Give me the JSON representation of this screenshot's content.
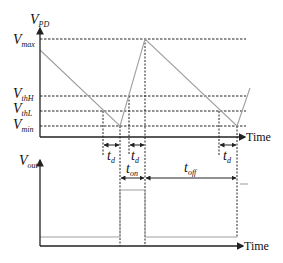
{
  "top_plot": {
    "y_axis_label": "V",
    "y_axis_label_sub": "PD",
    "x_axis_label": "Time",
    "levels": [
      {
        "key": "max",
        "label": "V",
        "sub": "max"
      },
      {
        "key": "thH",
        "label": "V",
        "sub": "thH"
      },
      {
        "key": "thL",
        "label": "V",
        "sub": "thL"
      },
      {
        "key": "min",
        "label": "V",
        "sub": "min"
      }
    ],
    "delay_labels": [
      {
        "label": "t",
        "sub": "d"
      },
      {
        "label": "t",
        "sub": "d"
      },
      {
        "label": "t",
        "sub": "d"
      }
    ]
  },
  "bottom_plot": {
    "y_axis_label": "V",
    "y_axis_label_sub": "out",
    "x_axis_label": "Time",
    "on_label": {
      "label": "t",
      "sub": "on"
    },
    "off_label": {
      "label": "t",
      "sub": "off"
    }
  },
  "colors": {
    "axis": "#222222",
    "waveform": "#a0a0a0",
    "dashed": "#222222"
  }
}
